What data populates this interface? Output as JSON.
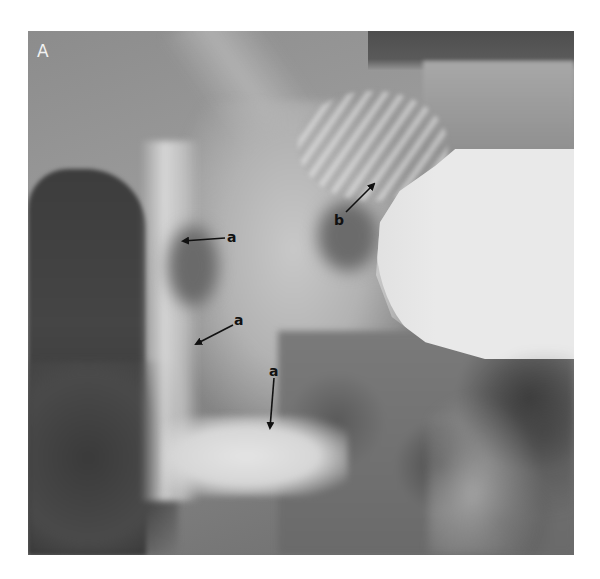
{
  "figure": {
    "panel_label": "A",
    "colors": {
      "contrast_fill": "#e9e9e9",
      "soft_tissue": "#8a8a8a",
      "gas_dark": "#3d3d3d",
      "annotation": "#111111",
      "panel_label": "#f2f2f2"
    }
  },
  "annotations": [
    {
      "label": "a",
      "arrow_from": [
        225,
        238
      ],
      "arrow_to": [
        183,
        241
      ],
      "label_pos": [
        227,
        230
      ]
    },
    {
      "label": "a",
      "arrow_from": [
        233,
        325
      ],
      "arrow_to": [
        196,
        344
      ],
      "label_pos": [
        234,
        313
      ]
    },
    {
      "label": "a",
      "arrow_from": [
        274,
        378
      ],
      "arrow_to": [
        270,
        428
      ],
      "label_pos": [
        269,
        364
      ]
    },
    {
      "label": "b",
      "arrow_from": [
        346,
        212
      ],
      "arrow_to": [
        374,
        184
      ],
      "label_pos": [
        334,
        213
      ]
    }
  ]
}
